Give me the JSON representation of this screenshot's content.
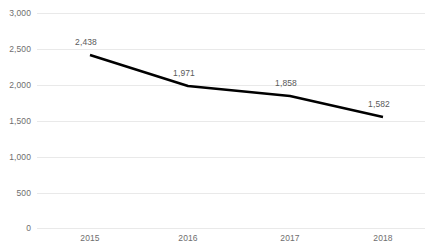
{
  "chart_data": {
    "type": "line",
    "title": "",
    "subtitle": "",
    "xlabel": "",
    "ylabel": "",
    "categories": [
      "2015",
      "2016",
      "2017",
      "2018"
    ],
    "values": [
      2438,
      1971,
      1858,
      1582
    ],
    "point_labels": [
      "2,438",
      "1,971",
      "1,858",
      "1,582"
    ],
    "ylim": [
      0,
      3000
    ],
    "ytick_values": [
      0,
      500,
      1000,
      1500,
      2000,
      2500,
      3000
    ],
    "ytick_labels": [
      "0",
      "500",
      "1,000",
      "1,500",
      "2,000",
      "2,500",
      "3,000"
    ],
    "grid": "horizontal",
    "legend": "none",
    "series": [
      {
        "name": "",
        "values": [
          2438,
          1971,
          1858,
          1582
        ]
      }
    ],
    "colors": {
      "line": "#000000",
      "gridline": "#e9e9e9",
      "tick_text": "#6e6e6e",
      "label_text": "#5a5a5a",
      "background": "#ffffff"
    },
    "geometry": {
      "plot_left": 37,
      "plot_right": 425,
      "plot_top": 13,
      "plot_bottom": 228,
      "x_positions": [
        90,
        188,
        290,
        383
      ],
      "y_positions": [
        55,
        86,
        96,
        117
      ],
      "gridline_y": [
        13,
        49,
        85,
        121,
        157,
        193,
        228
      ],
      "line_width": 2.5
    }
  }
}
